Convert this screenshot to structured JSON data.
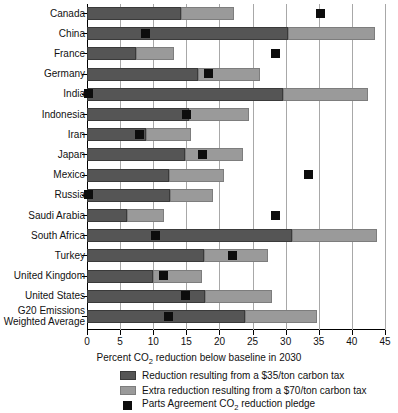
{
  "chart_data": {
    "type": "bar",
    "orientation": "horizontal",
    "stacked": true,
    "title": "",
    "xlabel": "Percent CO2 reduction below baseline in 2030",
    "ylabel": "",
    "xlim": [
      0,
      45
    ],
    "xticks": [
      0,
      5,
      10,
      15,
      20,
      25,
      30,
      35,
      40,
      45
    ],
    "grid": "vertical",
    "legend_position": "below-axis",
    "categories": [
      "Canada",
      "China",
      "France",
      "Germany",
      "India",
      "Indonesia",
      "Iran",
      "Japan",
      "Mexico",
      "Russia",
      "Saudi Arabia",
      "South Africa",
      "Turkey",
      "United Kingdom",
      "United States",
      "G20 Emissions Weighted Average"
    ],
    "series": [
      {
        "name": "Reduction resulting from a $35/ton carbon tax",
        "color": "#555555",
        "values": [
          14.2,
          30.4,
          7.4,
          16.7,
          29.6,
          15.4,
          8.9,
          14.8,
          12.4,
          12.6,
          6.1,
          30.9,
          17.6,
          9.9,
          17.8,
          23.8
        ]
      },
      {
        "name": "Extra reduction resulting from a $70/ton carbon tax",
        "color": "#9a9a9a",
        "values": [
          8.0,
          13.1,
          5.7,
          9.4,
          12.8,
          9.0,
          6.8,
          8.7,
          8.3,
          6.4,
          5.5,
          12.9,
          9.8,
          7.4,
          10.2,
          11.0
        ]
      }
    ],
    "totals": [
      22.2,
      43.5,
      13.1,
      26.1,
      42.4,
      24.4,
      15.7,
      23.5,
      20.7,
      19.0,
      11.6,
      43.8,
      27.4,
      17.3,
      28.0,
      34.8
    ],
    "markers": {
      "name": "Parts Agreement CO2 reduction pledge",
      "color": "#0d0d0d",
      "values": [
        35.3,
        8.9,
        28.5,
        18.4,
        0.3,
        15.0,
        8.0,
        17.4,
        33.5,
        0.3,
        28.5,
        10.4,
        21.9,
        11.5,
        14.8,
        12.3
      ]
    }
  },
  "axis": {
    "x_title_prefix": "Percent CO",
    "x_title_sub": "2",
    "x_title_suffix": " reduction below baseline in 2030",
    "tick_labels": [
      "0",
      "5",
      "10",
      "15",
      "20",
      "25",
      "30",
      "35",
      "40",
      "45"
    ]
  },
  "category_labels": [
    {
      "lines": [
        "Canada"
      ]
    },
    {
      "lines": [
        "China"
      ]
    },
    {
      "lines": [
        "France"
      ]
    },
    {
      "lines": [
        "Germany"
      ]
    },
    {
      "lines": [
        "India"
      ]
    },
    {
      "lines": [
        "Indonesia"
      ]
    },
    {
      "lines": [
        "Iran"
      ]
    },
    {
      "lines": [
        "Japan"
      ]
    },
    {
      "lines": [
        "Mexico"
      ]
    },
    {
      "lines": [
        "Russia"
      ]
    },
    {
      "lines": [
        "Saudi Arabia"
      ]
    },
    {
      "lines": [
        "South Africa"
      ]
    },
    {
      "lines": [
        "Turkey"
      ]
    },
    {
      "lines": [
        "United Kingdom"
      ]
    },
    {
      "lines": [
        "United States"
      ]
    },
    {
      "lines": [
        "G20 Emissions",
        "Weighted Average"
      ]
    }
  ],
  "legend": {
    "items": [
      {
        "swatch": "dark",
        "prefix": "Reduction resulting from a $35/ton carbon tax",
        "sub": "",
        "suffix": ""
      },
      {
        "swatch": "light",
        "prefix": "Extra reduction resulting from a $70/ton carbon tax",
        "sub": "",
        "suffix": ""
      },
      {
        "swatch": "pledge",
        "prefix": "Parts Agreement CO",
        "sub": "2",
        "suffix": " reduction pledge"
      }
    ]
  },
  "colors": {
    "series_35": "#555555",
    "series_70": "#9a9a9a",
    "pledge": "#0d0d0d",
    "grid": "#a8a8a8",
    "axis": "#000000",
    "background": "#ffffff"
  }
}
